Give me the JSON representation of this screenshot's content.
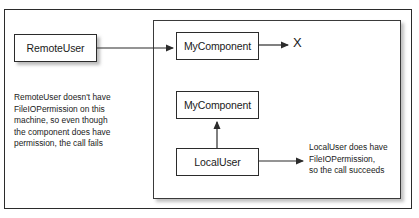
{
  "figure": {
    "colors": {
      "stroke": "#2b2b2b",
      "text": "#1a1a1a",
      "background": "#ffffff",
      "shadow": "#787878"
    }
  },
  "frames": {
    "outer_label": "figure-border",
    "inner_label": "local-machine-boundary"
  },
  "nodes": {
    "remote_user": "RemoteUser",
    "mycomponent_top": "MyComponent",
    "mycomponent_bottom": "MyComponent",
    "local_user": "LocalUser"
  },
  "markers": {
    "failure": "X"
  },
  "captions": {
    "left": "RemoteUser doesn't have\nFileIOPermission on this\nmachine, so even though\nthe component does have\npermission, the call fails",
    "right": "LocalUser does have\nFileIOPermission,\nso the call succeeds"
  },
  "arrows": [
    {
      "name": "remote-user-to-mycomponent",
      "from": "RemoteUser",
      "to": "MyComponent",
      "direction": "right"
    },
    {
      "name": "mycomponent-to-failure",
      "from": "MyComponent",
      "to": "X",
      "direction": "right"
    },
    {
      "name": "local-user-to-mycomponent",
      "from": "LocalUser",
      "to": "MyComponent",
      "direction": "up"
    },
    {
      "name": "local-user-to-caption",
      "from": "LocalUser",
      "to": "LocalUser does have FileIOPermission, so the call succeeds",
      "direction": "right"
    }
  ]
}
